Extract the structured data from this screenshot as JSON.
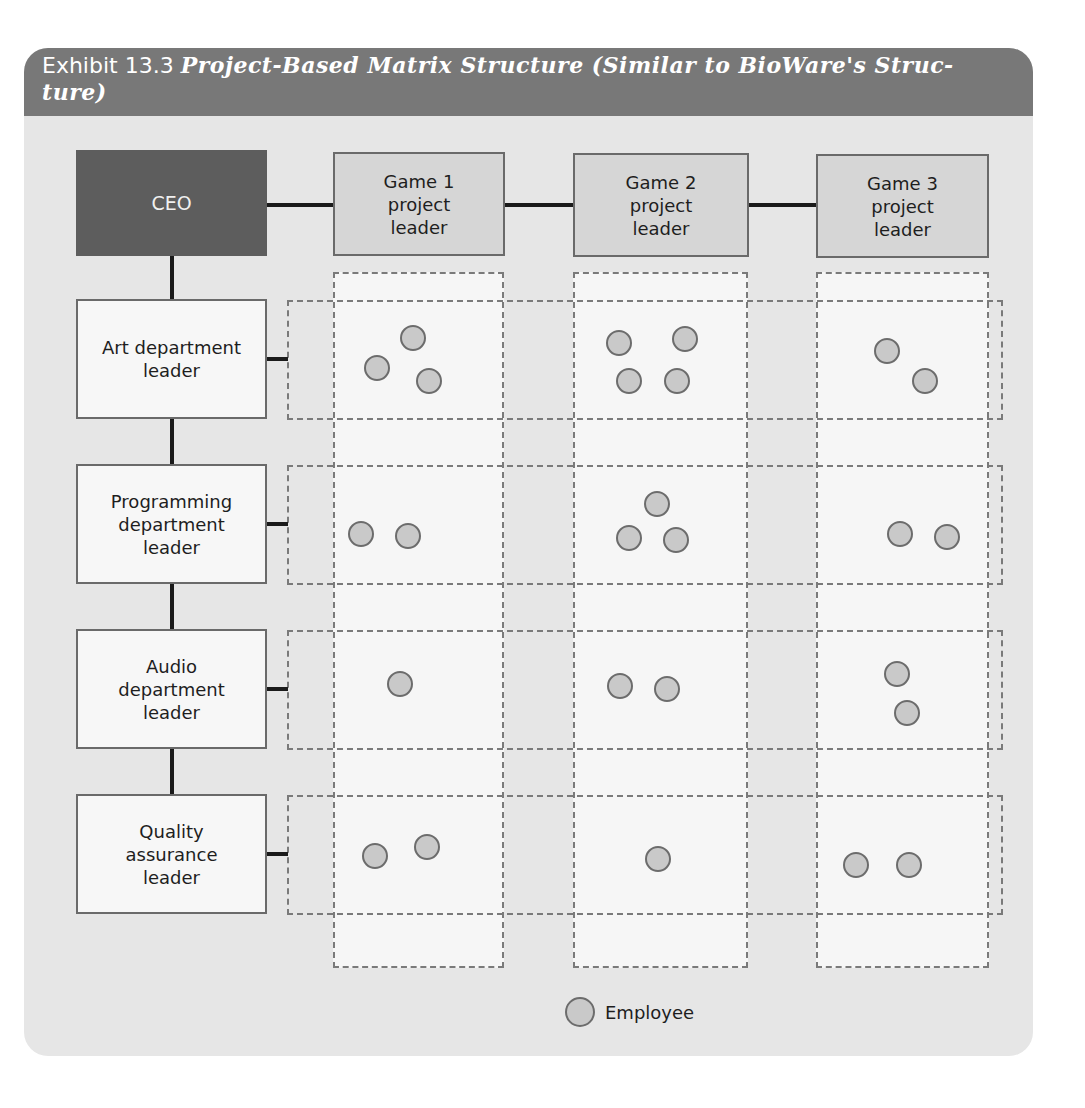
{
  "exhibit": {
    "number": "Exhibit 13.3",
    "title": "Project-Based Matrix Structure (Similar to BioWare's Struc-ture)"
  },
  "nodes": {
    "ceo": "CEO",
    "games": [
      {
        "line1": "Game 1",
        "line2": "project",
        "line3": "leader"
      },
      {
        "line1": "Game 2",
        "line2": "project",
        "line3": "leader"
      },
      {
        "line1": "Game 3",
        "line2": "project",
        "line3": "leader"
      }
    ],
    "departments": [
      {
        "lines": [
          "Art department",
          "leader"
        ]
      },
      {
        "lines": [
          "Programming",
          "department",
          "leader"
        ]
      },
      {
        "lines": [
          "Audio",
          "department",
          "leader"
        ]
      },
      {
        "lines": [
          "Quality",
          "assurance",
          "leader"
        ]
      }
    ]
  },
  "matrix": {
    "rows": [
      "Art",
      "Programming",
      "Audio",
      "Quality assurance"
    ],
    "columns": [
      "Game 1",
      "Game 2",
      "Game 3"
    ],
    "employee_counts": [
      [
        3,
        4,
        2
      ],
      [
        2,
        3,
        2
      ],
      [
        1,
        2,
        2
      ],
      [
        2,
        1,
        2
      ]
    ]
  },
  "legend": {
    "label": "Employee"
  },
  "colors": {
    "header": "#787878",
    "ceo": "#5d5d5d",
    "game_box": "#d6d6d6",
    "dept_box": "#f7f7f7",
    "employee": "#c9c9c9",
    "panel": "#e6e6e6"
  }
}
